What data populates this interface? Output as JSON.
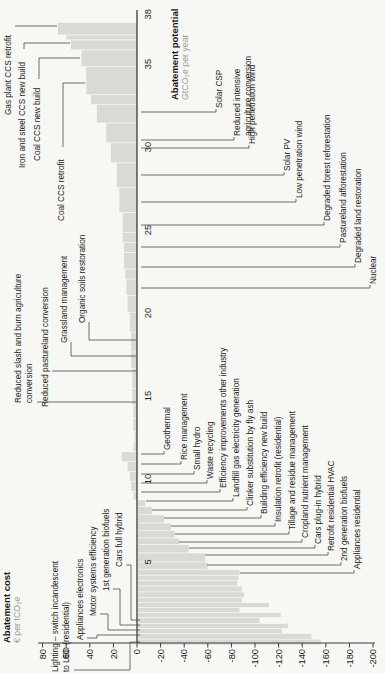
{
  "chart_data": {
    "type": "bar",
    "subtype": "marginal-abatement-cost-curve",
    "orientation_note": "landscape chart rotated 90deg counterclockwise in screenshot",
    "cost_axis": {
      "title": "Abatement cost",
      "unit": "€ per tCO₂e",
      "ticks": [
        80,
        60,
        40,
        20,
        0,
        -20,
        -40,
        -60,
        -80,
        -100,
        -120,
        -140,
        -160,
        -180,
        -200
      ],
      "range": [
        80,
        -200
      ]
    },
    "potential_axis": {
      "title": "Abatement potential",
      "unit": "GtCO₂e per year",
      "ticks": [
        5,
        10,
        15,
        20,
        25,
        30,
        35,
        38
      ],
      "range": [
        0,
        38
      ]
    },
    "bars": [
      {
        "w": 0.35,
        "c": -155,
        "m": "Lighting – switch incandescent to LED (residential)"
      },
      {
        "w": 0.35,
        "c": -147,
        "m": "Appliances electronics"
      },
      {
        "w": 0.3,
        "c": -122,
        "m": "Motor systems efficiency"
      },
      {
        "w": 0.3,
        "c": -127,
        "m": "1st generation biofuels"
      },
      {
        "w": 0.35,
        "c": -103,
        "m": "Cars full hybrid"
      },
      {
        "w": 0.3,
        "c": -121
      },
      {
        "w": 0.3,
        "c": -86
      },
      {
        "w": 0.3,
        "c": -111
      },
      {
        "w": 0.3,
        "c": -88
      },
      {
        "w": 0.35,
        "c": -90
      },
      {
        "w": 0.35,
        "c": -88
      },
      {
        "w": 0.35,
        "c": -84
      },
      {
        "w": 0.3,
        "c": -85
      },
      {
        "w": 0.35,
        "c": -86,
        "m": "Appliances residential"
      },
      {
        "w": 0.45,
        "c": -59,
        "m": "2nd generation biofuels"
      },
      {
        "w": 0.55,
        "c": -57,
        "m": "Retrofit residential HVAC"
      },
      {
        "w": 0.5,
        "c": -43,
        "m": "Cars plug-in hybrid"
      },
      {
        "w": 0.4,
        "c": -35,
        "m": "Cropland nutrient management"
      },
      {
        "w": 0.45,
        "c": -31,
        "m": "Tillage and residue management"
      },
      {
        "w": 0.45,
        "c": -28,
        "m": "Insulation retrofit (residential)"
      },
      {
        "w": 0.5,
        "c": -22,
        "m": "Building efficiency new build"
      },
      {
        "w": 0.5,
        "c": -12,
        "m": "Clinker substitution by fly ash"
      },
      {
        "w": 0.4,
        "c": -6,
        "m": "Landfill gas electricity generation"
      },
      {
        "w": 0.5,
        "c": 3,
        "m": "Efficiency improvements other industry"
      },
      {
        "w": 0.6,
        "c": 5,
        "m": "Waste recycling"
      },
      {
        "w": 0.6,
        "c": 6,
        "m": "Small hydro"
      },
      {
        "w": 0.6,
        "c": 8,
        "m": "Rice management"
      },
      {
        "w": 0.6,
        "c": 13,
        "m": "Geothermal"
      },
      {
        "w": 0.6,
        "c": 3
      },
      {
        "w": 0.6,
        "c": 2
      },
      {
        "w": 0.8,
        "c": 3
      },
      {
        "w": 0.8,
        "c": 3,
        "m": "Reduced slash and burn agriculture conversion"
      },
      {
        "w": 1.0,
        "c": 4
      },
      {
        "w": 1.2,
        "c": 4,
        "m": "Reduced pastureland conversion"
      },
      {
        "w": 1.0,
        "c": 5,
        "m": "Grassland management"
      },
      {
        "w": 1.2,
        "c": 5,
        "m": "Organic soils restoration"
      },
      {
        "w": 1.2,
        "c": 6
      },
      {
        "w": 1.0,
        "c": 8
      },
      {
        "w": 1.0,
        "c": 9,
        "m": "Nuclear"
      },
      {
        "w": 0.6,
        "c": 10
      },
      {
        "w": 1.0,
        "c": 11,
        "m": "Degraded land restoration"
      },
      {
        "w": 0.6,
        "c": 11,
        "m": "Pastureland afforestation"
      },
      {
        "w": 0.6,
        "c": 12
      },
      {
        "w": 1.2,
        "c": 12,
        "m": "Degraded forest reforestation"
      },
      {
        "w": 1.5,
        "c": 15,
        "m": "Low penetration wind"
      },
      {
        "w": 1.5,
        "c": 17,
        "m": "Solar PV"
      },
      {
        "w": 1.2,
        "c": 22,
        "m": "High penetration wind"
      },
      {
        "w": 1.2,
        "c": 26,
        "m": "Reduced intensive agriculture conversion"
      },
      {
        "w": 1.1,
        "c": 34,
        "m": "Solar CSP"
      },
      {
        "w": 0.6,
        "c": 39
      },
      {
        "w": 1.7,
        "c": 43,
        "m": "Coal CCS retrofit"
      },
      {
        "w": 1.0,
        "c": 47,
        "m": "Coal CCS new build"
      },
      {
        "w": 0.6,
        "c": 56,
        "m": "Iron and steel CCS new build"
      },
      {
        "w": 0.3,
        "c": 60
      },
      {
        "w": 0.75,
        "c": 67,
        "m": "Gas plant CCS retrofit"
      }
    ],
    "callouts": [
      {
        "group": "above",
        "lines": [
          "Lighting – switch incandescent",
          "to LED (residential)"
        ],
        "x": 1,
        "y": 51,
        "leader": [
          [
            3,
            74
          ],
          [
            3,
            130
          ],
          [
            31,
            130
          ],
          [
            31,
            140
          ]
        ]
      },
      {
        "group": "above",
        "lines": [
          "Appliances electronics"
        ],
        "x": 33,
        "y": 76,
        "leader": [
          [
            35,
            87
          ],
          [
            35,
            97
          ],
          [
            38,
            97
          ],
          [
            38,
            140
          ]
        ]
      },
      {
        "group": "above",
        "lines": [
          "Motor systems efficiency"
        ],
        "x": 57,
        "y": 89,
        "leader": [
          [
            59,
            100
          ],
          [
            59,
            108
          ],
          [
            43,
            108
          ],
          [
            43,
            140
          ]
        ]
      },
      {
        "group": "above",
        "lines": [
          "1st generation biofuels"
        ],
        "x": 82,
        "y": 102,
        "leader": [
          [
            84,
            113
          ],
          [
            84,
            120
          ],
          [
            48,
            120
          ],
          [
            48,
            140
          ]
        ]
      },
      {
        "group": "above",
        "lines": [
          "Cars full hybrid"
        ],
        "x": 106,
        "y": 115,
        "leader": [
          [
            108,
            126
          ],
          [
            108,
            131
          ],
          [
            53,
            131
          ],
          [
            53,
            140
          ]
        ]
      },
      {
        "group": "above",
        "lines": [
          "Reduced slash and burn agriculture",
          "conversion"
        ],
        "x": 270,
        "y": 14,
        "leader": [
          [
            271,
            37
          ],
          [
            271,
            136
          ]
        ]
      },
      {
        "group": "above",
        "lines": [
          "Reduced pastureland conversion"
        ],
        "x": 266,
        "y": 41,
        "leader": [
          [
            302,
            52
          ],
          [
            302,
            136
          ]
        ]
      },
      {
        "group": "above",
        "lines": [
          "Grassland management"
        ],
        "x": 330,
        "y": 60,
        "leader": [
          [
            331,
            71
          ],
          [
            317,
            71
          ],
          [
            317,
            136
          ]
        ]
      },
      {
        "group": "above",
        "lines": [
          "Organic soils restoration"
        ],
        "x": 350,
        "y": 78,
        "leader": [
          [
            351,
            89
          ],
          [
            333,
            89
          ],
          [
            333,
            136
          ]
        ]
      },
      {
        "group": "above",
        "lines": [
          "Gas plant CCS retrofit"
        ],
        "x": 558,
        "y": 4,
        "leader": [
          [
            647,
            15
          ],
          [
            647,
            57
          ]
        ]
      },
      {
        "group": "above",
        "lines": [
          "Iron and steel CCS new build"
        ],
        "x": 505,
        "y": 18,
        "leader": [
          [
            624,
            24
          ],
          [
            630,
            24
          ],
          [
            630,
            70
          ]
        ]
      },
      {
        "group": "above",
        "lines": [
          "Coal CCS new build"
        ],
        "x": 512,
        "y": 33,
        "leader": [
          [
            594,
            39
          ],
          [
            615,
            39
          ],
          [
            615,
            80
          ]
        ]
      },
      {
        "group": "above",
        "lines": [
          "Coal CCS retrofit"
        ],
        "x": 452,
        "y": 57,
        "leader": [
          [
            526,
            63
          ],
          [
            590,
            63
          ],
          [
            590,
            85
          ]
        ]
      },
      {
        "group": "cascade",
        "lines": [
          "Solar CSP"
        ],
        "bx": 561,
        "baseline": 222,
        "from": 141
      },
      {
        "group": "cascade",
        "lines": [
          "Reduced intensive",
          "agriculture conversion"
        ],
        "bx": 533,
        "baseline": 240,
        "from": 141
      },
      {
        "group": "cascade",
        "lines": [
          "High penetration wind"
        ],
        "bx": 525,
        "baseline": 255,
        "from": 141
      },
      {
        "group": "cascade",
        "lines": [
          "Solar PV"
        ],
        "bx": 498,
        "baseline": 290,
        "from": 141
      },
      {
        "group": "cascade",
        "lines": [
          "Low penetration wind"
        ],
        "bx": 471,
        "baseline": 302,
        "from": 141
      },
      {
        "group": "cascade",
        "lines": [
          "Degraded forest reforestation"
        ],
        "bx": 448,
        "baseline": 330,
        "from": 141
      },
      {
        "group": "cascade",
        "lines": [
          "Pastureland afforestation"
        ],
        "bx": 426,
        "baseline": 346,
        "from": 141
      },
      {
        "group": "cascade",
        "lines": [
          "Degraded land restoration"
        ],
        "bx": 406,
        "baseline": 361,
        "from": 141
      },
      {
        "group": "cascade",
        "lines": [
          "Nuclear"
        ],
        "bx": 385,
        "baseline": 376,
        "from": 141
      },
      {
        "group": "cascade",
        "lines": [
          "Geothermal"
        ],
        "bx": 219,
        "baseline": 170,
        "from": 141
      },
      {
        "group": "cascade",
        "lines": [
          "Rice management"
        ],
        "bx": 209,
        "baseline": 187,
        "from": 141
      },
      {
        "group": "cascade",
        "lines": [
          "Small hydro"
        ],
        "bx": 199,
        "baseline": 200,
        "from": 141
      },
      {
        "group": "cascade",
        "lines": [
          "Waste recycling"
        ],
        "bx": 190,
        "baseline": 213,
        "from": 141
      },
      {
        "group": "cascade",
        "lines": [
          "Efficiency improvements other industry"
        ],
        "bx": 181,
        "baseline": 226,
        "from": 141
      },
      {
        "group": "cascade",
        "lines": [
          "Landfill gas electricity generation"
        ],
        "bx": 172,
        "baseline": 239,
        "from": 146
      },
      {
        "group": "cascade",
        "lines": [
          "Clinker substitution by fly ash"
        ],
        "bx": 163,
        "baseline": 253,
        "from": 152
      },
      {
        "group": "cascade",
        "lines": [
          "Building efficiency new build"
        ],
        "bx": 155,
        "baseline": 267,
        "from": 164
      },
      {
        "group": "cascade",
        "lines": [
          "Insulation retrofit (residential)"
        ],
        "bx": 147,
        "baseline": 281,
        "from": 171
      },
      {
        "group": "cascade",
        "lines": [
          "Tillage and residue management"
        ],
        "bx": 139,
        "baseline": 295,
        "from": 175
      },
      {
        "group": "cascade",
        "lines": [
          "Cropland nutrient management"
        ],
        "bx": 131,
        "baseline": 308,
        "from": 179
      },
      {
        "group": "cascade",
        "lines": [
          "Cars plug-in hybrid"
        ],
        "bx": 125,
        "baseline": 321,
        "from": 189
      },
      {
        "group": "cascade",
        "lines": [
          "Retrofit residential HVAC"
        ],
        "bx": 118,
        "baseline": 334,
        "from": 205
      },
      {
        "group": "cascade",
        "lines": [
          "2nd generation biofuels"
        ],
        "bx": 108,
        "baseline": 347,
        "from": 207
      },
      {
        "group": "cascade",
        "lines": [
          "Appliances residential"
        ],
        "bx": 100,
        "baseline": 360,
        "from": 240
      }
    ]
  }
}
